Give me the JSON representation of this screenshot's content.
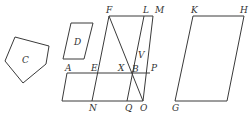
{
  "diagram": {
    "type": "geometry-figure",
    "stroke_color": "#3a3a3a",
    "shapes": {
      "pentagon_C": {
        "label": "C",
        "points": "15,37 49,46 46,64 23,83 5,61",
        "label_pos": [
          22,
          63
        ]
      },
      "parallelogram_D": {
        "label": "D",
        "points": "71,23 93,23 84,59 63,59",
        "label_pos": [
          74,
          45
        ]
      },
      "parallelogram_KHG": {
        "points": "193,16 244,16 227,101 175,101"
      }
    },
    "segments": [
      {
        "name": "FM",
        "x1": 109,
        "y1": 16,
        "x2": 153,
        "y2": 16
      },
      {
        "name": "AP",
        "x1": 67,
        "y1": 73,
        "x2": 150,
        "y2": 73
      },
      {
        "name": "base-NO",
        "x1": 62,
        "y1": 101,
        "x2": 143,
        "y2": 101
      },
      {
        "name": "A-left-side",
        "x1": 67,
        "y1": 73,
        "x2": 62,
        "y2": 101
      },
      {
        "name": "FN",
        "x1": 109,
        "y1": 16,
        "x2": 92,
        "y2": 101
      },
      {
        "name": "FO",
        "x1": 109,
        "y1": 16,
        "x2": 143,
        "y2": 101
      },
      {
        "name": "LQ",
        "x1": 144,
        "y1": 16,
        "x2": 127,
        "y2": 101
      },
      {
        "name": "MO",
        "x1": 153,
        "y1": 16,
        "x2": 143,
        "y2": 101
      }
    ],
    "labels": {
      "C": "C",
      "D": "D",
      "F": "F",
      "L": "L",
      "M": "M",
      "A": "A",
      "E": "E",
      "X": "X",
      "B": "B",
      "P": "P",
      "V": "V",
      "N": "N",
      "Q": "Q",
      "O": "O",
      "K": "K",
      "H": "H",
      "G": "G"
    }
  }
}
